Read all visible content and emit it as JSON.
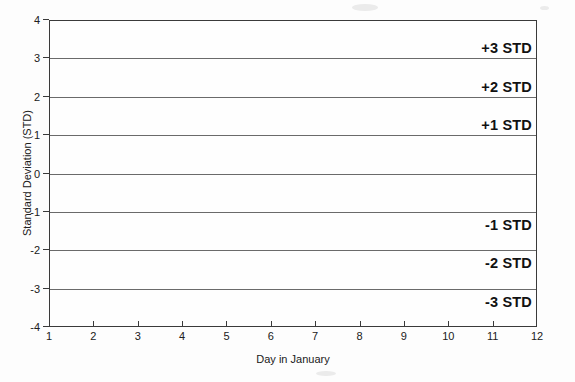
{
  "chart_data": {
    "type": "line",
    "title": "",
    "xlabel": "Day in January",
    "ylabel": "Standard Deviation (STD)",
    "xlim": [
      1,
      12
    ],
    "ylim": [
      -4,
      4
    ],
    "grid": true,
    "legend": "none",
    "x_ticks": [
      "1",
      "2",
      "3",
      "4",
      "5",
      "6",
      "7",
      "8",
      "9",
      "10",
      "11",
      "12"
    ],
    "y_ticks": [
      "4",
      "3",
      "2",
      "1",
      "0",
      "-1",
      "-2",
      "-3",
      "-4"
    ],
    "gridline_values": [
      3,
      2,
      1,
      0,
      -1,
      -2,
      -3
    ],
    "series": [],
    "annotations": [
      {
        "label": "+3 STD",
        "value": 3,
        "position": "above"
      },
      {
        "label": "+2 STD",
        "value": 2,
        "position": "above"
      },
      {
        "label": "+1 STD",
        "value": 1,
        "position": "above"
      },
      {
        "label": "-1 STD",
        "value": -1,
        "position": "below"
      },
      {
        "label": "-2 STD",
        "value": -2,
        "position": "below"
      },
      {
        "label": "-3 STD",
        "value": -3,
        "position": "below"
      }
    ],
    "colors": {
      "axis": "#3a3a3a",
      "gridline": "#6a6a6a",
      "annotation_text": "#111111",
      "tick_text": "#202020",
      "background": "#fdfdfd"
    }
  }
}
